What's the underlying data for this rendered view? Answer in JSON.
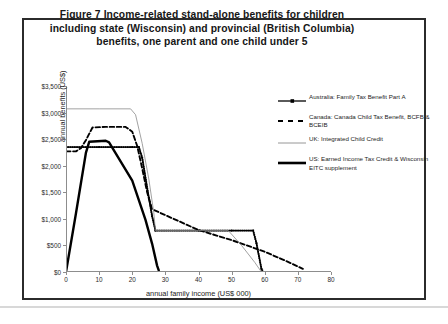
{
  "figure": {
    "title_line1": "Figure 7   Income-related stand-alone benefits for children",
    "title_line2": "including state (Wisconsin) and provincial (British Columbia)",
    "title_line3": "benefits, one parent and one child under 5"
  },
  "chart_data": {
    "type": "line",
    "title": "Figure 7   Income-related stand-alone benefits for children including state (Wisconsin) and provincial (British Columbia) benefits, one parent and one child under 5",
    "xlabel": "annual family income (US$ 000)",
    "ylabel": "annual benefits (US$)",
    "xlim": [
      0,
      80
    ],
    "ylim": [
      0,
      3500
    ],
    "xticks": [
      0,
      10,
      20,
      30,
      40,
      50,
      60,
      70,
      80
    ],
    "xtick_labels": [
      "0",
      "10",
      "20",
      "30",
      "40",
      "50",
      "60",
      "70",
      "80"
    ],
    "yticks": [
      0,
      500,
      1000,
      1500,
      2000,
      2500,
      3000,
      3500
    ],
    "ytick_labels": [
      "$0",
      "$500",
      "$1,000",
      "$1,500",
      "$2,000",
      "$2,500",
      "$3,000",
      "$3,500"
    ],
    "grid": false,
    "legend_position": "right",
    "series": [
      {
        "name": "Australia: Family Tax Benefit Part A",
        "style": "solid-with-square-markers",
        "color": "#000000",
        "points": [
          [
            0,
            2350
          ],
          [
            10,
            2350
          ],
          [
            20,
            2350
          ],
          [
            22,
            2350
          ],
          [
            23,
            2150
          ],
          [
            25,
            1400
          ],
          [
            26,
            1050
          ],
          [
            27,
            780
          ],
          [
            40,
            780
          ],
          [
            50,
            780
          ],
          [
            56.5,
            780
          ],
          [
            57.5,
            540
          ],
          [
            59,
            60
          ],
          [
            59.5,
            0
          ]
        ]
      },
      {
        "name": "Canada: Canada Child Tax Benefit, BCFB & BCEIB",
        "style": "dashed",
        "color": "#000000",
        "points": [
          [
            0,
            2270
          ],
          [
            3,
            2270
          ],
          [
            4.5,
            2330
          ],
          [
            6,
            2480
          ],
          [
            8,
            2720
          ],
          [
            12,
            2730
          ],
          [
            18,
            2730
          ],
          [
            20,
            2640
          ],
          [
            21.5,
            2370
          ],
          [
            23,
            1950
          ],
          [
            24.5,
            1500
          ],
          [
            26,
            1180
          ],
          [
            27.5,
            1140
          ],
          [
            40,
            790
          ],
          [
            50,
            600
          ],
          [
            56,
            470
          ],
          [
            60,
            380
          ],
          [
            66,
            220
          ],
          [
            71.5,
            60
          ]
        ]
      },
      {
        "name": "UK: Integrated Child Credit",
        "style": "thin-solid",
        "color": "#8a8a8a",
        "points": [
          [
            0,
            3070
          ],
          [
            10,
            3070
          ],
          [
            19.5,
            3070
          ],
          [
            21,
            2960
          ],
          [
            23,
            2420
          ],
          [
            25,
            1750
          ],
          [
            26.5,
            1120
          ],
          [
            27,
            780
          ],
          [
            40,
            780
          ],
          [
            49,
            780
          ],
          [
            53,
            500
          ],
          [
            57,
            180
          ],
          [
            59,
            0
          ]
        ]
      },
      {
        "name": "US: Earned Income Tax Credit & Wisconsin EITC supplement",
        "style": "thick-solid",
        "color": "#000000",
        "points": [
          [
            0,
            0
          ],
          [
            3,
            1100
          ],
          [
            6,
            2240
          ],
          [
            7,
            2450
          ],
          [
            12,
            2470
          ],
          [
            13,
            2440
          ],
          [
            20,
            1720
          ],
          [
            24,
            980
          ],
          [
            26,
            530
          ],
          [
            27.5,
            120
          ],
          [
            28,
            30
          ]
        ]
      }
    ]
  },
  "legend": {
    "items": [
      {
        "label": "Australia: Family Tax Benefit Part A",
        "marker": "line-with-markers"
      },
      {
        "label": "Canada: Canada Child Tax Benefit, BCFB & BCEIB",
        "marker": "dashed-line"
      },
      {
        "label": "UK: Integrated Child Credit",
        "marker": "thin-line"
      },
      {
        "label": "US: Earned Income Tax Credit & Wisconsin EITC supplement",
        "marker": "thick-line"
      }
    ]
  }
}
